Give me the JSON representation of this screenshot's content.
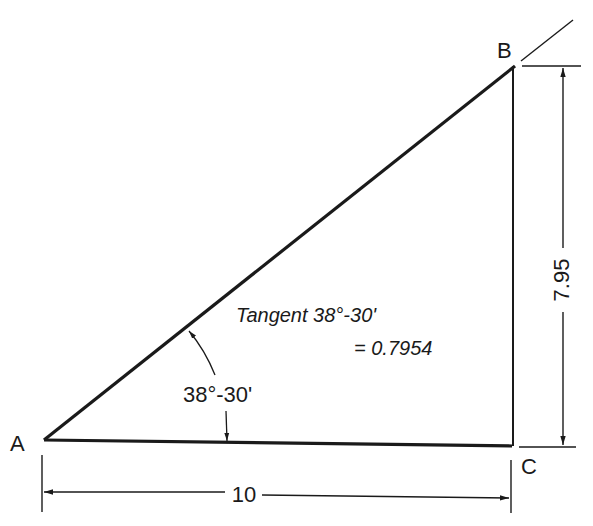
{
  "diagram": {
    "type": "right-triangle",
    "vertices": {
      "A": {
        "label": "A"
      },
      "B": {
        "label": "B"
      },
      "C": {
        "label": "C"
      }
    },
    "angle_label": "38°-30'",
    "annotation": {
      "line1": "Tangent 38°-30'",
      "line2": "= 0.7954"
    },
    "dimensions": {
      "horizontal": "10",
      "vertical": "7.95"
    },
    "colors": {
      "line": "#1a1a1a",
      "background": "#ffffff"
    }
  }
}
